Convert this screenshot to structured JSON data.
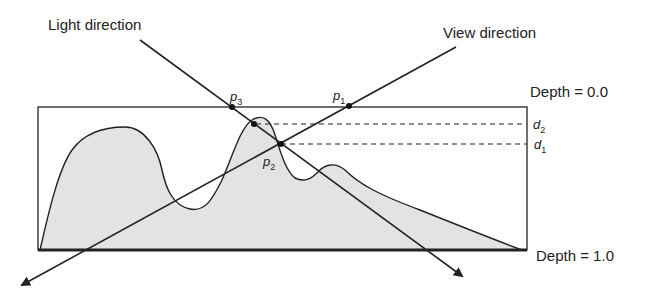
{
  "labels": {
    "light_direction": "Light direction",
    "view_direction": "View direction",
    "depth_top": "Depth = 0.0",
    "depth_bottom": "Depth = 1.0"
  },
  "points": {
    "p1": {
      "letter": "p",
      "sub": "1"
    },
    "p2": {
      "letter": "p",
      "sub": "2"
    },
    "p3": {
      "letter": "p",
      "sub": "3"
    }
  },
  "depths": {
    "d1": {
      "letter": "d",
      "sub": "1"
    },
    "d2": {
      "letter": "d",
      "sub": "2"
    }
  },
  "colors": {
    "stroke": "#222222",
    "terrain_fill": "#e3e3e3"
  }
}
